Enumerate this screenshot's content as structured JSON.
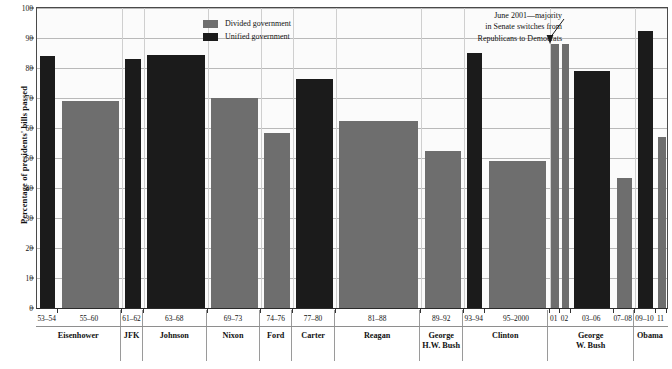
{
  "chart_data": {
    "type": "bar",
    "title": "",
    "xlabel": "",
    "ylabel": "Percentage of presidents' bills passed",
    "ylim": [
      0,
      100
    ],
    "yticks": [
      0,
      10,
      20,
      30,
      40,
      50,
      60,
      70,
      80,
      90,
      100
    ],
    "grid": true,
    "legend_position": "top-center",
    "legend": [
      {
        "key": "divided",
        "label": "Divided government",
        "color": "#6e6e6e"
      },
      {
        "key": "unified",
        "label": "Unified government",
        "color": "#1b1b1b"
      }
    ],
    "annotations": [
      {
        "name": "senate-switch-note",
        "lines": [
          "June 2001—majority",
          "in Senate switches from",
          "Republicans to Democrats"
        ],
        "points_to": "01"
      }
    ],
    "categories": [
      "53–54",
      "55–60",
      "61–62",
      "63–68",
      "69–73",
      "74–76",
      "77–80",
      "81–88",
      "89–92",
      "93–94",
      "95–2000",
      "01",
      "02",
      "03–06",
      "07–08",
      "09–10",
      "11"
    ],
    "values": [
      84,
      69,
      83,
      84.5,
      70,
      58.5,
      76.5,
      62.5,
      52.5,
      85,
      49,
      88,
      88,
      79,
      43.5,
      92.5,
      57
    ],
    "bars": [
      {
        "term": "53–54",
        "value": 84,
        "type": "unified",
        "president": "Eisenhower"
      },
      {
        "term": "55–60",
        "value": 69,
        "type": "divided",
        "president": "Eisenhower"
      },
      {
        "term": "61–62",
        "value": 83,
        "type": "unified",
        "president": "JFK"
      },
      {
        "term": "63–68",
        "value": 84.5,
        "type": "unified",
        "president": "Johnson"
      },
      {
        "term": "69–73",
        "value": 70,
        "type": "divided",
        "president": "Nixon"
      },
      {
        "term": "74–76",
        "value": 58.5,
        "type": "divided",
        "president": "Ford"
      },
      {
        "term": "77–80",
        "value": 76.5,
        "type": "unified",
        "president": "Carter"
      },
      {
        "term": "81–88",
        "value": 62.5,
        "type": "divided",
        "president": "Reagan"
      },
      {
        "term": "89–92",
        "value": 52.5,
        "type": "divided",
        "president": "George H.W. Bush"
      },
      {
        "term": "93–94",
        "value": 85,
        "type": "unified",
        "president": "Clinton"
      },
      {
        "term": "95–2000",
        "value": 49,
        "type": "divided",
        "president": "Clinton"
      },
      {
        "term": "01",
        "value": 88,
        "type": "divided",
        "president": "George W. Bush"
      },
      {
        "term": "02",
        "value": 88,
        "type": "divided",
        "president": "George W. Bush"
      },
      {
        "term": "03–06",
        "value": 79,
        "type": "unified",
        "president": "George W. Bush"
      },
      {
        "term": "07–08",
        "value": 43.5,
        "type": "divided",
        "president": "George W. Bush"
      },
      {
        "term": "09–10",
        "value": 92.5,
        "type": "unified",
        "president": "Obama"
      },
      {
        "term": "11",
        "value": 57,
        "type": "divided",
        "president": "Obama"
      }
    ],
    "presidents": [
      {
        "name_line1": "Eisenhower",
        "name_line2": "",
        "terms": [
          "53–54",
          "55–60"
        ]
      },
      {
        "name_line1": "JFK",
        "name_line2": "",
        "terms": [
          "61–62"
        ]
      },
      {
        "name_line1": "Johnson",
        "name_line2": "",
        "terms": [
          "63–68"
        ]
      },
      {
        "name_line1": "Nixon",
        "name_line2": "",
        "terms": [
          "69–73"
        ]
      },
      {
        "name_line1": "Ford",
        "name_line2": "",
        "terms": [
          "74–76"
        ]
      },
      {
        "name_line1": "Carter",
        "name_line2": "",
        "terms": [
          "77–80"
        ]
      },
      {
        "name_line1": "Reagan",
        "name_line2": "",
        "terms": [
          "81–88"
        ]
      },
      {
        "name_line1": "George",
        "name_line2": "H.W. Bush",
        "terms": [
          "89–92"
        ]
      },
      {
        "name_line1": "Clinton",
        "name_line2": "",
        "terms": [
          "93–94",
          "95–2000"
        ]
      },
      {
        "name_line1": "George",
        "name_line2": "W. Bush",
        "terms": [
          "01",
          "02",
          "03–06",
          "07–08"
        ]
      },
      {
        "name_line1": "Obama",
        "name_line2": "",
        "terms": [
          "09–10",
          "11"
        ]
      }
    ]
  }
}
